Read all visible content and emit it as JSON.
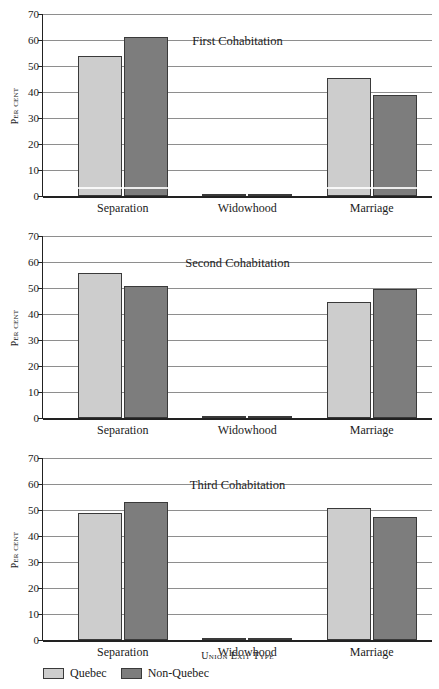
{
  "chart_data": [
    {
      "type": "bar",
      "title": "First Cohabitation",
      "xlabel": "Union Exit Type",
      "ylabel": "Per cent",
      "ylim": [
        0,
        70
      ],
      "yticks": [
        0,
        10,
        20,
        30,
        40,
        50,
        60,
        70
      ],
      "grid": true,
      "legend_position": "bottom",
      "categories": [
        "Separation",
        "Widowhood",
        "Marriage"
      ],
      "series": [
        {
          "name": "Quebec",
          "color": "#cdcdcd",
          "values": [
            53.8,
            0.8,
            45.5
          ]
        },
        {
          "name": "Non-Quebec",
          "color": "#7d7d7d",
          "values": [
            61.0,
            0.8,
            38.8
          ]
        }
      ]
    },
    {
      "type": "bar",
      "title": "Second Cohabitation",
      "xlabel": "Union Exit Type",
      "ylabel": "Per cent",
      "ylim": [
        0,
        70
      ],
      "yticks": [
        0,
        10,
        20,
        30,
        40,
        50,
        60,
        70
      ],
      "grid": true,
      "legend_position": "bottom",
      "categories": [
        "Separation",
        "Widowhood",
        "Marriage"
      ],
      "series": [
        {
          "name": "Quebec",
          "color": "#cdcdcd",
          "values": [
            55.8,
            0.2,
            44.5
          ]
        },
        {
          "name": "Non-Quebec",
          "color": "#7d7d7d",
          "values": [
            50.7,
            0.2,
            49.6
          ]
        }
      ]
    },
    {
      "type": "bar",
      "title": "Third Cohabitation",
      "xlabel": "Union Exit Type",
      "ylabel": "Per cent",
      "ylim": [
        0,
        70
      ],
      "yticks": [
        0,
        10,
        20,
        30,
        40,
        50,
        60,
        70
      ],
      "grid": true,
      "legend_position": "bottom",
      "categories": [
        "Separation",
        "Widowhood",
        "Marriage"
      ],
      "series": [
        {
          "name": "Quebec",
          "color": "#cdcdcd",
          "values": [
            49.0,
            0.3,
            50.8
          ]
        },
        {
          "name": "Non-Quebec",
          "color": "#7d7d7d",
          "values": [
            53.0,
            0.3,
            47.3
          ]
        }
      ]
    }
  ],
  "figure": {
    "xaxis_title": "Union Exit Type",
    "yaxis_title": "Per cent",
    "categories": [
      "Separation",
      "Widowhood",
      "Marriage"
    ],
    "ytick_labels": [
      "0",
      "10",
      "20",
      "30",
      "40",
      "50",
      "60",
      "70"
    ],
    "panel_titles": [
      "First Cohabitation",
      "Second Cohabitation",
      "Third Cohabitation"
    ],
    "legend": [
      {
        "label": "Quebec",
        "color": "#cdcdcd"
      },
      {
        "label": "Non-Quebec",
        "color": "#7d7d7d"
      }
    ]
  }
}
